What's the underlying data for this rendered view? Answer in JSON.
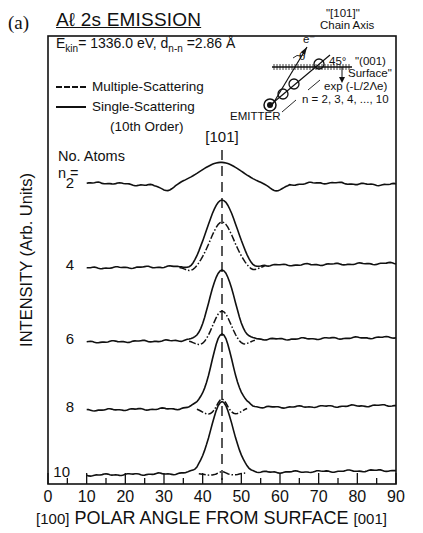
{
  "panel_label": "(a)",
  "title": "Aℓ 2s EMISSION",
  "subtitle": "E_kin = 1336.0 eV, d_n-n = 2.86 Å",
  "subtitle_display": "Ekin= 1336.0 eV, dn-n =2.86 Å",
  "legend": {
    "multiple": "Multiple-Scattering",
    "single": "Single-Scattering",
    "single_note": "(10th Order)"
  },
  "n_header": {
    "line1": "No. Atoms",
    "line2": "n ="
  },
  "direction_label": "[101]",
  "inset": {
    "chain_axis_line1": "\"[101]\"",
    "chain_axis_line2": "Chain Axis",
    "electron": "e⁻",
    "theta": "θ",
    "angle": "45°",
    "surface_line1": "\"(001)",
    "surface_line2": "Surface\"",
    "attenuation": "exp (-L/2Λe)",
    "n_range": "n = 2, 3, 4, ..., 10",
    "emitter": "EMITTER"
  },
  "xaxis": {
    "label": "POLAR ANGLE FROM SURFACE",
    "left_end": "[100]",
    "right_end": "[001]",
    "ticks": [
      "0",
      "10",
      "20",
      "30",
      "40",
      "50",
      "60",
      "70",
      "80",
      "90"
    ]
  },
  "yaxis": {
    "label": "INTENSITY (Arb. Units)"
  },
  "chart_data": {
    "type": "line",
    "title": "Aℓ 2s EMISSION",
    "subtitle": "E_kin = 1336.0 eV, d_n-n = 2.86 Å",
    "xlabel": "[100] POLAR ANGLE FROM SURFACE [001]",
    "ylabel": "INTENSITY (Arb. Units)",
    "xlim": [
      0,
      90
    ],
    "xticks": [
      0,
      10,
      20,
      30,
      40,
      50,
      60,
      70,
      80,
      90
    ],
    "grid": false,
    "legend": [
      "Multiple-Scattering (dash-dot)",
      "Single-Scattering (solid, 10th Order)"
    ],
    "legend_position": "upper left",
    "annotations": [
      "[101] chain axis at 45° (vertical dashed line)",
      "No. Atoms n = 2, 4, 6, 8, 10"
    ],
    "reference_line_x": 45,
    "curves_note": "Curves vertically offset; baseline and peak heights in pixel-relative units (baseline_y = screen y of baseline, peak_height = px above baseline)",
    "series": [
      {
        "n": 2,
        "name": "n=2",
        "baseline_y": 184,
        "single_peak_height": 20,
        "single_width_deg": 7.5,
        "multiple_peak_height": 20,
        "multiple_width_deg": 7.5,
        "side_minima_deg": [
          31,
          59
        ],
        "side_min_depth": 6
      },
      {
        "n": 4,
        "name": "n=4",
        "baseline_y": 266,
        "single_peak_height": 66,
        "single_width_deg": 5.2,
        "multiple_peak_height": 44,
        "multiple_width_deg": 4.2,
        "side_minima_deg": [
          37,
          53
        ],
        "side_min_depth": 5
      },
      {
        "n": 6,
        "name": "n=6",
        "baseline_y": 340,
        "single_peak_height": 70,
        "single_width_deg": 4.6,
        "multiple_peak_height": 29,
        "multiple_width_deg": 3.0,
        "side_minima_deg": [
          39.5,
          50.5
        ],
        "side_min_depth": 5
      },
      {
        "n": 8,
        "name": "n=8",
        "baseline_y": 408,
        "single_peak_height": 75,
        "single_width_deg": 4.3,
        "multiple_peak_height": 10,
        "multiple_width_deg": 1.6,
        "side_minima_deg": [
          41.5,
          48.5
        ],
        "side_min_depth": 6
      },
      {
        "n": 10,
        "name": "n=10",
        "baseline_y": 473,
        "single_peak_height": 72,
        "single_width_deg": 4.3,
        "multiple_peak_height": 2,
        "multiple_width_deg": 1.2,
        "side_minima_deg": [
          42,
          48
        ],
        "side_min_depth": 2
      }
    ]
  },
  "style": {
    "ink": "#111111",
    "background": "#ffffff"
  }
}
